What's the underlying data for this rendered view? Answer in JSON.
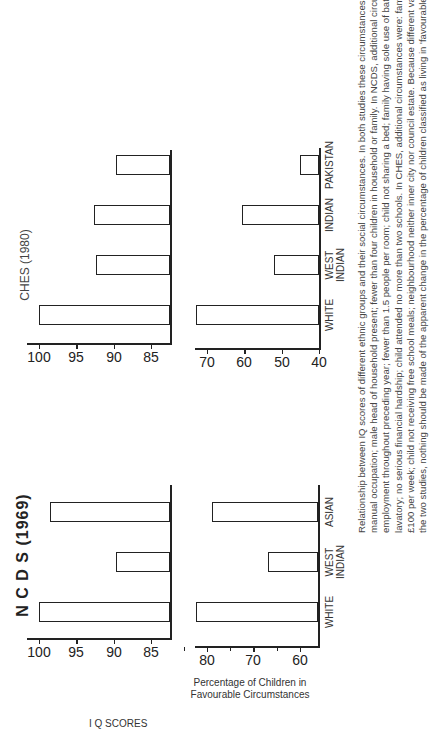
{
  "figure": {
    "orientation": "rotated-90-ccw",
    "caption_lines": [
      "Relationship between IQ scores of different ethnic groups and their social circumstances. In both studies these circumstances included: father in non-",
      "manual occupation; male head of household present; fewer than four children in household or family. In NCDS, additional circumstances were: father in",
      "employment throughout preceding year; fewer than 1.5 people per room; child not sharing a bed; family having sole use of bathroom, hot water and",
      "lavatory; no serious financial hardship; child attended no more than two schools. In CHES, additional circumstances were: family income more than",
      "£100 per week; child not receiving free school meals; neighbourhood neither inner city nor council estate. Because different variables are available for",
      "the two studies, nothing should be made of the apparent change in the percentage of children classified as living in 'favourable' circumstances."
    ]
  },
  "ncds": {
    "title": "N C D S (1969)",
    "iq_ylabel": "I Q SCORES",
    "pct_ylabel": "Percentage of Children in\nFavourable Circumstances",
    "categories": [
      "WHITE",
      "WEST\nINDIAN",
      "ASIAN"
    ]
  },
  "ches": {
    "title": "CHES (1980)",
    "categories": [
      "WHITE",
      "WEST\nINDIAN",
      "INDIAN",
      "PAKISTAN"
    ]
  },
  "chart_data": [
    {
      "type": "bar",
      "title": "N C D S (1969)",
      "panel": "IQ scores",
      "categories": [
        "WHITE",
        "WEST INDIAN",
        "ASIAN"
      ],
      "values": [
        100,
        89.7,
        98.5
      ],
      "xlabel": "",
      "ylabel": "I Q SCORES",
      "yticks": [
        85,
        90,
        95,
        100
      ],
      "ylim": [
        82.5,
        101
      ],
      "grid": false
    },
    {
      "type": "bar",
      "title": "N C D S (1969)",
      "panel": "Percentage of Children in Favourable Circumstances",
      "categories": [
        "WHITE",
        "WEST INDIAN",
        "ASIAN"
      ],
      "values": [
        82.4,
        66.8,
        79
      ],
      "xlabel": "",
      "ylabel": "Percentage of Children in Favourable Circumstances",
      "yticks": [
        60,
        70,
        80
      ],
      "ylim": [
        56,
        85
      ],
      "grid": false
    },
    {
      "type": "bar",
      "title": "CHES (1980)",
      "panel": "IQ scores",
      "categories": [
        "WHITE",
        "WEST INDIAN",
        "INDIAN",
        "PAKISTAN"
      ],
      "values": [
        100,
        92.4,
        92.7,
        89.7
      ],
      "xlabel": "",
      "ylabel": "",
      "yticks": [
        85,
        90,
        95,
        100
      ],
      "ylim": [
        82.5,
        101
      ],
      "grid": false
    },
    {
      "type": "bar",
      "title": "CHES (1980)",
      "panel": "Percentage of Children in Favourable Circumstances",
      "categories": [
        "WHITE",
        "WEST INDIAN",
        "INDIAN",
        "PAKISTAN"
      ],
      "values": [
        73,
        52,
        60.5,
        45
      ],
      "xlabel": "",
      "ylabel": "",
      "yticks": [
        40,
        50,
        60,
        70
      ],
      "ylim": [
        40,
        73
      ],
      "grid": false
    }
  ]
}
